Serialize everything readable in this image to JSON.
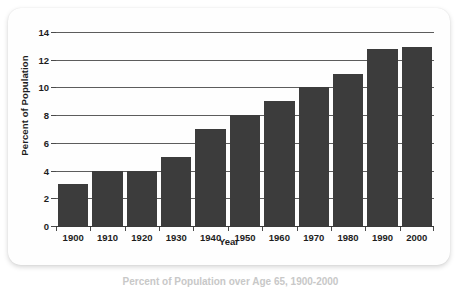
{
  "figure": {
    "caption": "Percent of Population over Age 65, 1900-2000"
  },
  "colors": {
    "bar": "#3c3c3c",
    "gridline": "#5d5d5d",
    "axis": "#3a3a3a",
    "card_background": "#fefefe",
    "page_background": "#ffffff",
    "text": "#1d1d1d"
  },
  "chart_data": {
    "type": "bar",
    "title": "",
    "xlabel": "Year",
    "ylabel": "Percent of Population",
    "categories": [
      "1900",
      "1910",
      "1920",
      "1930",
      "1940",
      "1950",
      "1960",
      "1970",
      "1980",
      "1990",
      "2000"
    ],
    "values": [
      3,
      4,
      4,
      5,
      7,
      8,
      9,
      10,
      11,
      12.8,
      12.9
    ],
    "ylim": [
      0,
      14
    ],
    "yticks": [
      0,
      2,
      4,
      6,
      8,
      10,
      12,
      14
    ],
    "ytick_labels": [
      "0",
      "2",
      "4",
      "6",
      "8",
      "10",
      "12",
      "14"
    ],
    "grid": "horizontal",
    "legend": "none",
    "series": [
      {
        "name": "Percent of Population",
        "values": [
          3,
          4,
          4,
          5,
          7,
          8,
          9,
          10,
          11,
          12.8,
          12.9
        ]
      }
    ]
  }
}
